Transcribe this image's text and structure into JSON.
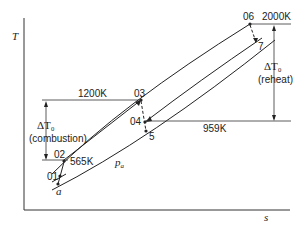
{
  "diagram": {
    "type": "T-s diagram (gas turbine with reheat)",
    "axes": {
      "y_label": "T",
      "x_label": "s"
    },
    "temperature_levels": {
      "t03": "1200K",
      "t06": "2000K",
      "t02": "565K",
      "t04": "959K"
    },
    "state_points": {
      "p01": "01",
      "p02": "02",
      "p03": "03",
      "p04": "04",
      "p5": "5",
      "p06": "06",
      "p7": "7",
      "pa": "a"
    },
    "annotations": {
      "combustion_delta": "ΔT₀",
      "combustion_label": "(combustion)",
      "reheat_delta": "ΔT₀",
      "reheat_label": "(reheat)",
      "isobar_label": "p",
      "isobar_sub": "a"
    }
  }
}
